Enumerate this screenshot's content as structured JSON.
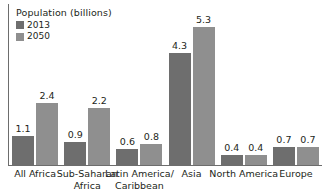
{
  "chart_data": {
    "type": "bar",
    "title": "Population (billions)",
    "xlabel": "",
    "ylabel": "",
    "ylim": [
      0,
      6.2
    ],
    "grid": false,
    "legend_position": "top-left",
    "categories": [
      "All Africa",
      "Sub-Saharan\nAfrica",
      "Latin America/\nCaribbean",
      "Asia",
      "North America",
      "Europe"
    ],
    "series": [
      {
        "name": "2013",
        "color": "#6e6e6e",
        "values": [
          1.1,
          0.9,
          0.6,
          4.3,
          0.4,
          0.7
        ],
        "labels": [
          "1.1",
          "0.9",
          "0.6",
          "4.3",
          "0.4",
          "0.7"
        ]
      },
      {
        "name": "2050",
        "color": "#8f8f8f",
        "values": [
          2.4,
          2.2,
          0.8,
          5.3,
          0.4,
          0.7
        ],
        "labels": [
          "2.4",
          "2.2",
          "0.8",
          "5.3",
          "0.4",
          "0.7"
        ]
      }
    ]
  },
  "legend": {
    "title": "Population (billions)",
    "items": [
      {
        "label": "2013",
        "color": "#6e6e6e"
      },
      {
        "label": "2050",
        "color": "#8f8f8f"
      }
    ]
  },
  "axis": {
    "line_color": "#6d6d6d"
  }
}
